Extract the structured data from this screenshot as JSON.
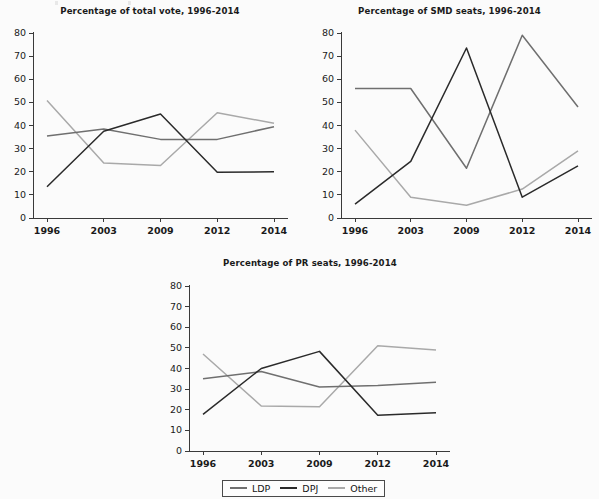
{
  "figure": {
    "background_color": "#fbfbfb",
    "x_categories": [
      "1996",
      "2003",
      "2009",
      "2012",
      "2014"
    ],
    "y_ticks": [
      "0",
      "10",
      "20",
      "30",
      "40",
      "50",
      "60",
      "70",
      "80"
    ],
    "series_colors": {
      "LDP": "#6f6f6f",
      "DPJ": "#2a2a2a",
      "Other": "#a9a9a9"
    }
  },
  "legend": {
    "entries": [
      {
        "label": "LDP",
        "color": "#6f6f6f"
      },
      {
        "label": "DPJ",
        "color": "#2a2a2a"
      },
      {
        "label": "Other",
        "color": "#a9a9a9"
      }
    ]
  },
  "chart_data": [
    {
      "type": "line",
      "id": "total-vote",
      "title": "Percentage of total vote, 1996-2014",
      "xlabel": "",
      "ylabel": "",
      "ylim": [
        0,
        80
      ],
      "yticks": [
        0,
        10,
        20,
        30,
        40,
        50,
        60,
        70,
        80
      ],
      "grid": false,
      "legend_position": "figure-bottom-center",
      "categories": [
        "1996",
        "2003",
        "2009",
        "2012",
        "2014"
      ],
      "series": [
        {
          "name": "LDP",
          "color": "#6f6f6f",
          "values": [
            35.5,
            38.5,
            34.0,
            34.0,
            39.5
          ]
        },
        {
          "name": "DPJ",
          "color": "#2a2a2a",
          "values": [
            13.5,
            37.5,
            45.0,
            19.8,
            20.0
          ]
        },
        {
          "name": "Other",
          "color": "#a9a9a9",
          "values": [
            50.8,
            23.8,
            22.7,
            45.5,
            41.0
          ]
        }
      ]
    },
    {
      "type": "line",
      "id": "smd-seats",
      "title": "Percentage of SMD seats, 1996-2014",
      "xlabel": "",
      "ylabel": "",
      "ylim": [
        0,
        80
      ],
      "yticks": [
        0,
        10,
        20,
        30,
        40,
        50,
        60,
        70,
        80
      ],
      "grid": false,
      "legend_position": "figure-bottom-center",
      "categories": [
        "1996",
        "2003",
        "2009",
        "2012",
        "2014"
      ],
      "series": [
        {
          "name": "LDP",
          "color": "#6f6f6f",
          "values": [
            56.0,
            56.0,
            21.5,
            79.0,
            48.0
          ]
        },
        {
          "name": "DPJ",
          "color": "#2a2a2a",
          "values": [
            6.0,
            24.5,
            73.5,
            9.0,
            22.5
          ]
        },
        {
          "name": "Other",
          "color": "#a9a9a9",
          "values": [
            38.0,
            9.0,
            5.5,
            12.5,
            29.0
          ]
        }
      ]
    },
    {
      "type": "line",
      "id": "pr-seats",
      "title": "Percentage of PR seats, 1996-2014",
      "xlabel": "",
      "ylabel": "",
      "ylim": [
        0,
        80
      ],
      "yticks": [
        0,
        10,
        20,
        30,
        40,
        50,
        60,
        70,
        80
      ],
      "grid": false,
      "legend_position": "figure-bottom-center",
      "categories": [
        "1996",
        "2003",
        "2009",
        "2012",
        "2014"
      ],
      "series": [
        {
          "name": "LDP",
          "color": "#6f6f6f",
          "values": [
            35.0,
            38.5,
            31.0,
            31.8,
            33.3
          ]
        },
        {
          "name": "DPJ",
          "color": "#2a2a2a",
          "values": [
            17.8,
            40.0,
            48.3,
            17.3,
            18.5
          ]
        },
        {
          "name": "Other",
          "color": "#a9a9a9",
          "values": [
            47.0,
            21.8,
            21.5,
            51.0,
            49.0
          ]
        }
      ]
    }
  ]
}
